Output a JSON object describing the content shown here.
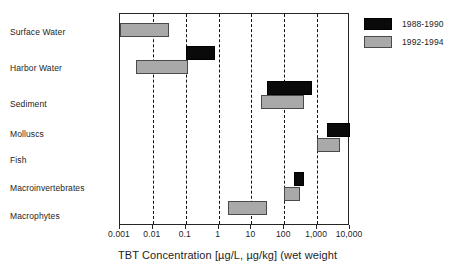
{
  "chart_data": {
    "type": "bar",
    "subtype": "horizontal-range-bars",
    "title": "",
    "xlabel": "TBT Concentration [µg/L, µg/kg] (wet weight",
    "ylabel": "",
    "xscale": "log",
    "xlim": [
      0.001,
      10000
    ],
    "grid": "vertical dashed gridlines at 0.01, 0.1, 1, 10, 100, 1000",
    "gridlines": [
      0.01,
      0.1,
      1,
      10,
      100,
      1000
    ],
    "xticks": [
      0.001,
      0.01,
      0.1,
      1,
      10,
      100,
      1000,
      10000
    ],
    "xticklabels": [
      "0.001",
      "0.01",
      "0.1",
      "1",
      "10",
      "100",
      "1,000",
      "10,000"
    ],
    "categories": [
      "Surface Water",
      "Harbor Water",
      "Sediment",
      "Molluscs",
      "Fish",
      "Macroinvertebrates",
      "Macrophytes"
    ],
    "legend": {
      "position": "top-right outside",
      "entries": [
        {
          "name": "1988-1990",
          "color": "#0a0a0a"
        },
        {
          "name": "1992-1994",
          "color": "#a9a9a9"
        }
      ]
    },
    "series": [
      {
        "name": "1988-1990",
        "color": "#0a0a0a",
        "ranges": [
          {
            "category": "Surface Water",
            "low": null,
            "high": null
          },
          {
            "category": "Harbor Water",
            "low": 0.1,
            "high": 0.8
          },
          {
            "category": "Sediment",
            "low": 30,
            "high": 700
          },
          {
            "category": "Molluscs",
            "low": 2000,
            "high": 10000
          },
          {
            "category": "Fish",
            "low": null,
            "high": null
          },
          {
            "category": "Macroinvertebrates",
            "low": 200,
            "high": 400
          },
          {
            "category": "Macrophytes",
            "low": null,
            "high": null
          }
        ]
      },
      {
        "name": "1992-1994",
        "color": "#a9a9a9",
        "ranges": [
          {
            "category": "Surface Water",
            "low": 0.001,
            "high": 0.03
          },
          {
            "category": "Harbor Water",
            "low": 0.003,
            "high": 0.12
          },
          {
            "category": "Sediment",
            "low": 20,
            "high": 400
          },
          {
            "category": "Molluscs",
            "low": 1000,
            "high": 5000
          },
          {
            "category": "Fish",
            "low": null,
            "high": null
          },
          {
            "category": "Macroinvertebrates",
            "low": 100,
            "high": 300
          },
          {
            "category": "Macrophytes",
            "low": 2,
            "high": 30
          }
        ]
      }
    ]
  },
  "categories": [
    {
      "label": "Surface Water"
    },
    {
      "label": "Harbor Water"
    },
    {
      "label": "Sediment"
    },
    {
      "label": "Molluscs"
    },
    {
      "label": "Fish"
    },
    {
      "label": "Macroinvertebrates"
    },
    {
      "label": "Macrophytes"
    }
  ],
  "xaxis": {
    "title": "TBT Concentration [µg/L, µg/kg] (wet weight",
    "ticks": [
      {
        "label": "0.001",
        "value": 0.001
      },
      {
        "label": "0.01",
        "value": 0.01
      },
      {
        "label": "0.1",
        "value": 0.1
      },
      {
        "label": "1",
        "value": 1
      },
      {
        "label": "10",
        "value": 10
      },
      {
        "label": "100",
        "value": 100
      },
      {
        "label": "1,000",
        "value": 1000
      },
      {
        "label": "10,000",
        "value": 10000
      }
    ]
  },
  "legend": {
    "items": [
      {
        "label": "1988-1990",
        "color": "#0a0a0a",
        "swatch": "black"
      },
      {
        "label": "1992-1994",
        "color": "#a9a9a9",
        "swatch": "gray"
      }
    ]
  },
  "bars": [
    {
      "series": "1992-1994",
      "swatch": "gray",
      "category": "Surface Water",
      "low": 0.001,
      "high": 0.03
    },
    {
      "series": "1988-1990",
      "swatch": "black",
      "category": "Harbor Water",
      "low": 0.1,
      "high": 0.8
    },
    {
      "series": "1992-1994",
      "swatch": "gray",
      "category": "Harbor Water",
      "low": 0.003,
      "high": 0.12
    },
    {
      "series": "1988-1990",
      "swatch": "black",
      "category": "Sediment",
      "low": 30,
      "high": 700
    },
    {
      "series": "1992-1994",
      "swatch": "gray",
      "category": "Sediment",
      "low": 20,
      "high": 400
    },
    {
      "series": "1988-1990",
      "swatch": "black",
      "category": "Molluscs",
      "low": 2000,
      "high": 10000
    },
    {
      "series": "1992-1994",
      "swatch": "gray",
      "category": "Molluscs",
      "low": 1000,
      "high": 5000
    },
    {
      "series": "1988-1990",
      "swatch": "black",
      "category": "Macroinvertebrates",
      "low": 200,
      "high": 400
    },
    {
      "series": "1992-1994",
      "swatch": "gray",
      "category": "Macroinvertebrates",
      "low": 100,
      "high": 300
    },
    {
      "series": "1992-1994",
      "swatch": "gray",
      "category": "Macrophytes",
      "low": 2,
      "high": 30
    }
  ],
  "layout": {
    "plot": {
      "left": 119,
      "top": 13,
      "width": 230,
      "height": 212
    },
    "bar_rows_y": [
      22,
      45,
      59,
      80,
      94,
      122,
      137,
      171,
      186,
      200
    ],
    "category_label_y": [
      27,
      63,
      99,
      129,
      155,
      183,
      211
    ]
  }
}
